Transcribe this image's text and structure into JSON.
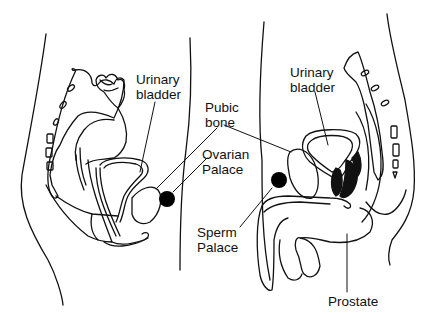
{
  "diagram": {
    "type": "anatomical-cross-section",
    "panels": [
      {
        "name": "female-pelvis",
        "side": "left"
      },
      {
        "name": "male-pelvis",
        "side": "right"
      }
    ],
    "labels": {
      "female_bladder": {
        "line1": "Urinary",
        "line2": "bladder"
      },
      "pubic_bone": {
        "line1": "Pubic",
        "line2": "bone"
      },
      "ovarian_palace": {
        "line1": "Ovarian",
        "line2": "Palace"
      },
      "sperm_palace": {
        "line1": "Sperm",
        "line2": "Palace"
      },
      "male_bladder": {
        "line1": "Urinary",
        "line2": "bladder"
      },
      "prostate": {
        "text": "Prostate"
      }
    },
    "markers": [
      {
        "name": "ovarian-palace-dot",
        "color": "#000000"
      },
      {
        "name": "sperm-palace-dot",
        "color": "#000000"
      }
    ],
    "colors": {
      "line": "#111111",
      "fill": "#000000",
      "background": "#ffffff"
    }
  }
}
